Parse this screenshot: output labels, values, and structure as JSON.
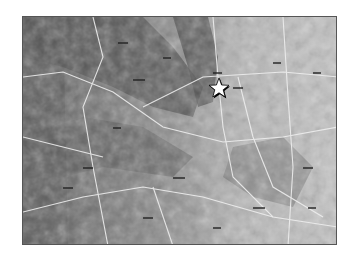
{
  "map": {
    "type": "shaded-relief grayscale map",
    "marker": {
      "icon": "star-icon",
      "x": 218,
      "y": 88,
      "fill": "#ffffff",
      "stroke": "#000000"
    },
    "colors": {
      "background": "#ffffff",
      "terrain_light": "#c8c8c8",
      "terrain_dark": "#4a4a4a",
      "roads": "#f2f2f2",
      "frame": "#555555"
    }
  }
}
